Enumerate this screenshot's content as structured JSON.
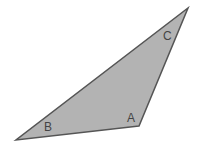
{
  "diagram": {
    "type": "triangle",
    "colors": {
      "fill": "#b3b3b3",
      "stroke": "#555555",
      "label": "#444444",
      "background": "#ffffff"
    },
    "vertices": [
      {
        "name": "A",
        "x": 139,
        "y": 126,
        "label_x": 127,
        "label_y": 122
      },
      {
        "name": "B",
        "x": 16,
        "y": 140,
        "label_x": 44,
        "label_y": 131
      },
      {
        "name": "C",
        "x": 188,
        "y": 8,
        "label_x": 163,
        "label_y": 40
      }
    ],
    "labels": {
      "a": "A",
      "b": "B",
      "c": "C"
    }
  }
}
